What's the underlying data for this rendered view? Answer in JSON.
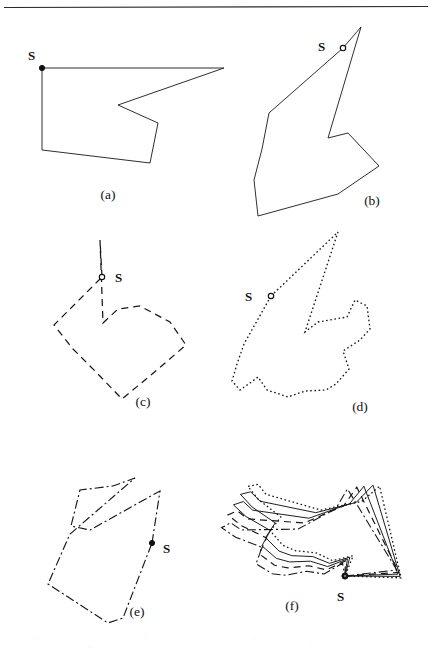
{
  "figure": {
    "background_color": "#ffffff",
    "ink_color": "#171717",
    "top_rule": {
      "present": true,
      "y": 7,
      "x1": 4,
      "x2": 428
    },
    "start_label": "S",
    "panels": [
      {
        "id": "a",
        "caption": "(a)",
        "caption_x": 108,
        "caption_y": 198,
        "line_style": "solid",
        "dash_array": "",
        "stroke_width": 0.9,
        "start_marker": "filled",
        "start_point": [
          42,
          68
        ],
        "start_label_x": 29,
        "start_label_y": 57,
        "points": [
          [
            42,
            68
          ],
          [
            224,
            68
          ],
          [
            118,
            105
          ],
          [
            158,
            123
          ],
          [
            150,
            163
          ],
          [
            42,
            150
          ]
        ]
      },
      {
        "id": "b",
        "caption": "(b)",
        "caption_x": 370,
        "caption_y": 203,
        "line_style": "solid",
        "dash_array": "",
        "stroke_width": 0.9,
        "start_marker": "open",
        "start_point": [
          343,
          48
        ],
        "start_label_x": 321,
        "start_label_y": 46,
        "points": [
          [
            343,
            48
          ],
          [
            361,
            27
          ],
          [
            328,
            138
          ],
          [
            348,
            133
          ],
          [
            379,
            166
          ],
          [
            338,
            194
          ],
          [
            258,
            216
          ],
          [
            254,
            180
          ],
          [
            262,
            149
          ],
          [
            269,
            113
          ]
        ]
      },
      {
        "id": "c",
        "caption": "(c)",
        "caption_x": 140,
        "caption_y": 404,
        "line_style": "dashed",
        "dash_array": "7 5",
        "stroke_width": 1.25,
        "start_marker": "open",
        "start_point": [
          102,
          277
        ],
        "start_label_x": 117,
        "start_label_y": 278,
        "points": [
          [
            102,
            277
          ],
          [
            100,
            240
          ],
          [
            103,
            323
          ],
          [
            118,
            309
          ],
          [
            140,
            306
          ],
          [
            170,
            322
          ],
          [
            186,
            345
          ],
          [
            151,
            375
          ],
          [
            122,
            399
          ],
          [
            96,
            372
          ],
          [
            73,
            349
          ],
          [
            54,
            325
          ]
        ]
      },
      {
        "id": "d",
        "caption": "(d)",
        "caption_x": 358,
        "caption_y": 409,
        "line_style": "dotted",
        "dash_array": "1.6 2.6",
        "stroke_width": 1.35,
        "start_marker": "open",
        "start_point": [
          271,
          296
        ],
        "start_label_x": 249,
        "start_label_y": 297,
        "points": [
          [
            271,
            296
          ],
          [
            338,
            232
          ],
          [
            305,
            332
          ],
          [
            318,
            322
          ],
          [
            347,
            317
          ],
          [
            355,
            300
          ],
          [
            367,
            306
          ],
          [
            370,
            329
          ],
          [
            360,
            340
          ],
          [
            343,
            351
          ],
          [
            349,
            369
          ],
          [
            336,
            384
          ],
          [
            326,
            390
          ],
          [
            305,
            391
          ],
          [
            288,
            397
          ],
          [
            267,
            390
          ],
          [
            258,
            377
          ],
          [
            250,
            383
          ],
          [
            240,
            390
          ],
          [
            232,
            381
          ],
          [
            237,
            364
          ],
          [
            244,
            344
          ]
        ]
      },
      {
        "id": "e",
        "caption": "(e)",
        "caption_x": 135,
        "caption_y": 614,
        "line_style": "dash-dot",
        "dash_array": "9 3 2 3",
        "stroke_width": 1.15,
        "start_marker": "filled",
        "start_point": [
          152,
          543
        ],
        "start_label_x": 166,
        "start_label_y": 549,
        "points": [
          [
            152,
            543
          ],
          [
            160,
            491
          ],
          [
            90,
            530
          ],
          [
            71,
            526
          ],
          [
            80,
            490
          ],
          [
            113,
            486
          ],
          [
            135,
            478
          ],
          [
            70,
            534
          ],
          [
            48,
            584
          ],
          [
            108,
            623
          ],
          [
            123,
            618
          ]
        ]
      },
      {
        "id": "f",
        "caption": "(f)",
        "caption_x": 290,
        "caption_y": 608,
        "line_style": "overlay",
        "start_marker": "filled",
        "start_point": [
          345,
          576
        ],
        "start_label_x": 340,
        "start_label_y": 598,
        "description": "all five polygons superimposed, aligned at their common start vertex S"
      }
    ],
    "overlay_shapes": [
      {
        "style": "solid",
        "dash_array": "",
        "stroke_width": 0.9,
        "rotation_deg": 0
      },
      {
        "style": "solid",
        "dash_array": "",
        "stroke_width": 0.9,
        "rotation_deg": 4
      },
      {
        "style": "dashed",
        "dash_array": "7 5",
        "stroke_width": 1.2,
        "rotation_deg": -5
      },
      {
        "style": "dotted",
        "dash_array": "1.6 2.6",
        "stroke_width": 1.3,
        "rotation_deg": 8
      },
      {
        "style": "dash-dot",
        "dash_array": "9 3 2 3",
        "stroke_width": 1.1,
        "rotation_deg": -10
      }
    ]
  }
}
